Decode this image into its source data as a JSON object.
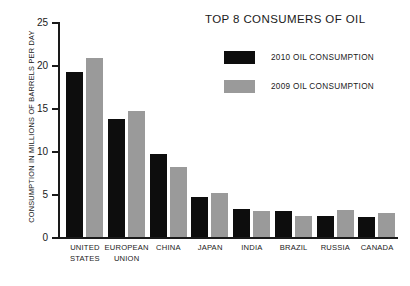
{
  "chart_data": {
    "type": "bar",
    "title": "TOP 8 CONSUMERS OF OIL",
    "xlabel": "",
    "ylabel": "CONSUMPTION IN MILLIONS OF BARRELS PER DAY",
    "ylim": [
      0,
      25
    ],
    "yticks": [
      0,
      5,
      10,
      15,
      20,
      25
    ],
    "ytick_labels": [
      "0",
      "5",
      "10",
      "15",
      "20",
      "25"
    ],
    "grid": false,
    "legend_position": "top-right",
    "categories": [
      "UNITED STATES",
      "EUROPEAN UNION",
      "CHINA",
      "JAPAN",
      "INDIA",
      "BRAZIL",
      "RUSSIA",
      "CANADA"
    ],
    "category_lines": [
      [
        "UNITED",
        "STATES"
      ],
      [
        "EUROPEAN",
        "UNION"
      ],
      [
        "CHINA"
      ],
      [
        "JAPAN"
      ],
      [
        "INDIA"
      ],
      [
        "BRAZIL"
      ],
      [
        "RUSSIA"
      ],
      [
        "CANADA"
      ]
    ],
    "series": [
      {
        "name": "2010 OIL CONSUMPTION",
        "color": "#0d0d0d",
        "values": [
          19.2,
          13.7,
          9.6,
          4.65,
          3.2,
          3.0,
          2.4,
          2.3
        ]
      },
      {
        "name": "2009 OIL CONSUMPTION",
        "color": "#9a9a9a",
        "values": [
          20.8,
          14.6,
          8.1,
          5.1,
          3.05,
          2.45,
          3.1,
          2.8
        ]
      }
    ]
  },
  "legend": {
    "items": [
      {
        "label": "2010 OIL CONSUMPTION",
        "color": "#0d0d0d"
      },
      {
        "label": "2009 OIL CONSUMPTION",
        "color": "#9a9a9a"
      }
    ]
  },
  "colors": {
    "axis": "#1a1a1a",
    "text": "#1a1a1a",
    "background": "#ffffff",
    "series_2010": "#0d0d0d",
    "series_2009": "#9a9a9a"
  }
}
